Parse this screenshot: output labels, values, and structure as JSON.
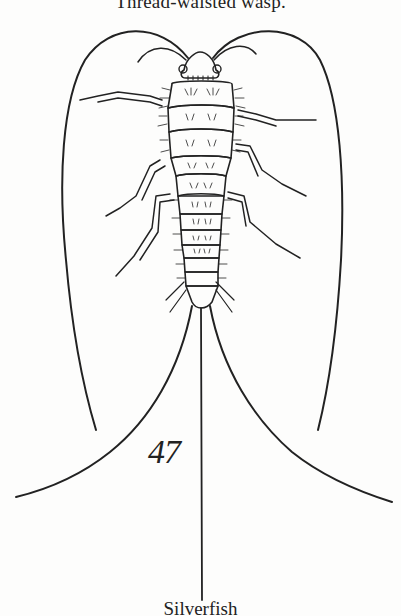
{
  "page": {
    "caption_top": "Thread-waisted wasp.",
    "caption_bottom": "Silverfish",
    "figure_number": "47"
  },
  "illustration": {
    "subject": "silverfish",
    "style": "black ink line drawing",
    "parts": [
      "antennae",
      "head",
      "thorax",
      "legs",
      "abdomen",
      "cerci",
      "median-filament"
    ],
    "ink_color": "#222222",
    "paper_color": "#fdfdfc"
  }
}
